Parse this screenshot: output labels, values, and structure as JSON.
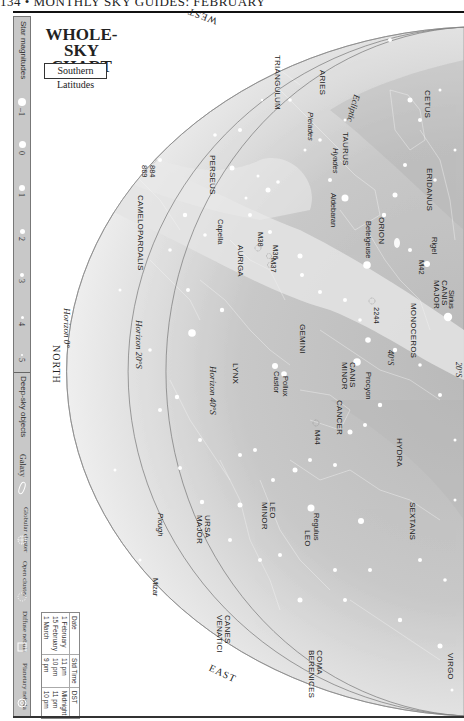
{
  "page": {
    "header": "134 • MONTHLY SKY GUIDES: FEBRUARY"
  },
  "title": {
    "line1": "WHOLE-SKY",
    "line2": "CHART",
    "subtitle": "Southern Latitudes"
  },
  "legend": {
    "magnitudes_title": "Star magnitudes",
    "magnitudes": [
      "–1",
      "0",
      "1",
      "2",
      "3",
      "4",
      "5"
    ],
    "deep_sky_title": "Deep-sky objects",
    "deep_sky": [
      {
        "label": "Galaxy",
        "icon": "galaxy-ellipse-icon"
      },
      {
        "label": "Globular cluster",
        "icon": "globular-cluster-icon"
      },
      {
        "label": "Open cluster",
        "icon": "open-cluster-icon"
      },
      {
        "label": "Diffuse nebula",
        "icon": "diffuse-nebula-square-icon"
      },
      {
        "label": "Planetary nebula",
        "icon": "planetary-nebula-icon"
      }
    ]
  },
  "viewing_table": {
    "headers": [
      "Date",
      "Std Time",
      "DST"
    ],
    "rows": [
      [
        "1 February",
        "11 pm",
        "Midnight"
      ],
      [
        "15 February",
        "10 pm",
        "11 pm"
      ],
      [
        "1 March",
        "9 pm",
        "10 pm"
      ]
    ]
  },
  "directions": {
    "west": "WEST",
    "east": "EAST",
    "north": "NORTH"
  },
  "horizons": {
    "h0": "Horizon 0°",
    "h20": "Horizon 20°S",
    "h40": "Horizon 40°S",
    "h20_right": "20°S",
    "h40_right": "40°S"
  },
  "ecliptic": "Ecliptic",
  "constellations": [
    "TRIANGULUM",
    "ARIES",
    "CETUS",
    "TAURUS",
    "ERIDANUS",
    "PERSEUS",
    "ORION",
    "CANIS MAJOR",
    "MONOCEROS",
    "AURIGA",
    "CAMELOPARDALIS",
    "GEMINI",
    "CANIS MINOR",
    "LYNX",
    "CANCER",
    "HYDRA",
    "SEXTANS",
    "LEO",
    "LEO MINOR",
    "URSA MAJOR",
    "CANES VENATICI",
    "COMA BERENICES",
    "VIRGO"
  ],
  "stars": [
    "Aldebaran",
    "Betelgeuse",
    "Rigel",
    "Sirius",
    "Capella",
    "Procyon",
    "Pollux",
    "Castor",
    "Regulus",
    "Mizar"
  ],
  "asterisms": [
    "Pleiades",
    "Hyades",
    "Plough"
  ],
  "deep_sky_objects": [
    "M42",
    "M38",
    "M36",
    "M37",
    "2244",
    "884",
    "869",
    "M44"
  ],
  "colors": {
    "sky_light": "#f0f0f0",
    "sky_mid": "#dcdcdc",
    "sky_dark": "#bdbdbd",
    "milky_way": "#e6e6e6",
    "sidebar": "#c8c8c8",
    "text": "#222222"
  }
}
